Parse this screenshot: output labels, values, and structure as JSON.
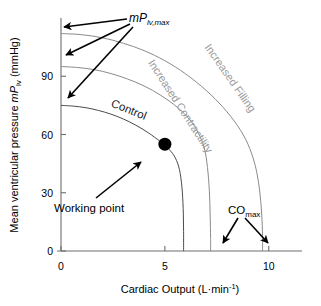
{
  "chart_data": {
    "type": "line",
    "title": "",
    "xlabel": "Cardiac Output (L·min⁻¹)",
    "ylabel": "Mean ventricular pressure mPlv (mmHg)",
    "xlim": [
      0,
      11.6
    ],
    "ylim": [
      0,
      120
    ],
    "xticks": [
      0,
      5,
      10
    ],
    "xticklabels": [
      "0",
      "5",
      "10"
    ],
    "yticks": [
      0,
      30,
      60,
      90
    ],
    "yticklabels": [
      "0",
      "30",
      "60",
      "90"
    ],
    "grid": false,
    "legend": "none",
    "series": [
      {
        "name": "Control",
        "label": "Control",
        "color": "#4a4a4a",
        "y_intercept": 75,
        "x_intercept": 5.9,
        "points": [
          [
            0.0,
            75.0
          ],
          [
            0.6,
            74.6
          ],
          [
            1.2,
            73.8
          ],
          [
            1.8,
            72.4
          ],
          [
            2.4,
            70.5
          ],
          [
            3.0,
            68.0
          ],
          [
            3.6,
            64.8
          ],
          [
            4.2,
            60.9
          ],
          [
            4.8,
            56.2
          ],
          [
            5.2,
            52.4
          ],
          [
            5.5,
            48.0
          ],
          [
            5.7,
            42.0
          ],
          [
            5.82,
            33.0
          ],
          [
            5.88,
            22.0
          ],
          [
            5.9,
            10.0
          ],
          [
            5.9,
            0.0
          ]
        ]
      },
      {
        "name": "Increased Contractility",
        "label": "Increased Contractility",
        "color": "#8a8a8a",
        "y_intercept": 95,
        "x_intercept": 7.2,
        "points": [
          [
            0.0,
            95.0
          ],
          [
            0.8,
            94.5
          ],
          [
            1.6,
            93.4
          ],
          [
            2.4,
            91.4
          ],
          [
            3.2,
            88.6
          ],
          [
            4.0,
            85.0
          ],
          [
            4.8,
            80.2
          ],
          [
            5.6,
            74.0
          ],
          [
            6.2,
            67.6
          ],
          [
            6.6,
            61.0
          ],
          [
            6.9,
            53.0
          ],
          [
            7.05,
            43.0
          ],
          [
            7.14,
            31.0
          ],
          [
            7.18,
            18.0
          ],
          [
            7.2,
            7.0
          ],
          [
            7.2,
            0.0
          ]
        ]
      },
      {
        "name": "Increased Filling",
        "label": "Increased Filling",
        "color": "#8a8a8a",
        "y_intercept": 112,
        "x_intercept": 9.7,
        "points": [
          [
            0.0,
            112.0
          ],
          [
            1.0,
            111.4
          ],
          [
            2.0,
            109.8
          ],
          [
            3.0,
            107.0
          ],
          [
            4.0,
            103.2
          ],
          [
            5.0,
            98.0
          ],
          [
            6.0,
            91.2
          ],
          [
            7.0,
            82.6
          ],
          [
            7.8,
            74.0
          ],
          [
            8.5,
            64.5
          ],
          [
            9.0,
            55.0
          ],
          [
            9.35,
            44.0
          ],
          [
            9.55,
            32.0
          ],
          [
            9.66,
            19.0
          ],
          [
            9.7,
            8.0
          ],
          [
            9.7,
            0.0
          ]
        ]
      }
    ],
    "markers": [
      {
        "name": "working-point",
        "label": "Working point",
        "x": 5.0,
        "y": 55.0,
        "color": "#000000",
        "radius": 6.5
      }
    ],
    "annotations": {
      "mplvmax": {
        "base": "mP",
        "subscript": "lv,max",
        "targets": [
          {
            "x": 0,
            "y": 112
          },
          {
            "x": 0,
            "y": 95
          },
          {
            "x": 0,
            "y": 75
          }
        ]
      },
      "comax": {
        "base": "CO",
        "subscript": "max",
        "targets": [
          {
            "x": 7.2,
            "y": 0
          },
          {
            "x": 9.7,
            "y": 0
          }
        ]
      },
      "working_point": {
        "label": "Working point",
        "target": {
          "x": 5.0,
          "y": 55.0
        }
      }
    },
    "curve_labels": [
      {
        "text": "Control",
        "x": 3.2,
        "y": 71.0,
        "rotation": 22,
        "style": "dark"
      },
      {
        "text": "Increased Contractility",
        "x": 5.6,
        "y": 73.5,
        "rotation": 57,
        "style": "grey"
      },
      {
        "text": "Increased Filling",
        "x": 8.0,
        "y": 88.0,
        "rotation": 55,
        "style": "grey"
      }
    ]
  },
  "axes": {
    "x_title_main": "Cardiac Output (L·min",
    "x_title_sup": "-1",
    "x_title_close": ")",
    "y_title_pre": "Mean ventricular pressure ",
    "y_title_sym": "mP",
    "y_title_sub": "lv",
    "y_title_post": " (mmHg)"
  }
}
